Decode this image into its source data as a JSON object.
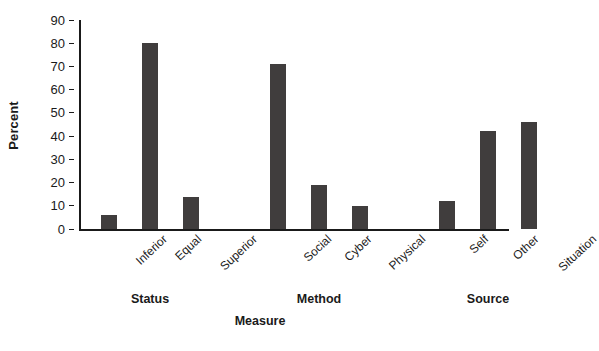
{
  "chart_data": {
    "type": "bar",
    "title": "",
    "subtitle": "",
    "xlabel": "Measure",
    "ylabel": "Percent",
    "ylim": [
      0,
      90
    ],
    "yticks": [
      0,
      10,
      20,
      30,
      40,
      50,
      60,
      70,
      80,
      90
    ],
    "ytick_labels": [
      "0",
      "10",
      "20",
      "30",
      "40",
      "50",
      "60",
      "70",
      "80",
      "90"
    ],
    "grid": false,
    "legend": false,
    "legend_position": "none",
    "bar_color": "#403d3d",
    "axis_color": "#1a1a1a",
    "background": "#ffffff",
    "categories": [
      "Inferior",
      "Equal",
      "Superior",
      "Social",
      "Cyber",
      "Physical",
      "Self",
      "Other",
      "Situation"
    ],
    "values": [
      6,
      80,
      14,
      71,
      19,
      10,
      12,
      42,
      46
    ],
    "groups": [
      {
        "label": "Status",
        "categories": [
          "Inferior",
          "Equal",
          "Superior"
        ],
        "values": [
          6,
          80,
          14
        ]
      },
      {
        "label": "Method",
        "categories": [
          "Social",
          "Cyber",
          "Physical"
        ],
        "values": [
          71,
          19,
          10
        ]
      },
      {
        "label": "Source",
        "categories": [
          "Self",
          "Other",
          "Situation"
        ],
        "values": [
          12,
          42,
          46
        ]
      }
    ]
  }
}
